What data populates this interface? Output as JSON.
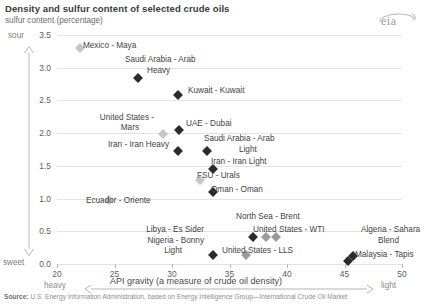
{
  "header": {
    "title": "Density and sulfur content of selected crude oils",
    "subtitle": "sulfur content (percentage)",
    "logo_text": "eia"
  },
  "axes": {
    "y_ticks": [
      "3.5",
      "3.0",
      "2.5",
      "2.0",
      "1.5",
      "1.0",
      "0.5",
      "0.0"
    ],
    "x_ticks": [
      "20",
      "25",
      "30",
      "35",
      "40",
      "45",
      "50"
    ],
    "y_top_label": "sour",
    "y_bottom_label": "sweet",
    "x_left_label": "heavy",
    "x_right_label": "light",
    "x_title": "API gravity (a measure of crude oil density)"
  },
  "footer": {
    "source_prefix": "Source:",
    "source_text": " U.S. Energy Information Administration, based on Energy Intelligence Group—International Crude Oil Market"
  },
  "chart_data": {
    "type": "scatter",
    "title": "Density and sulfur content of selected crude oils",
    "xlabel": "API gravity (a measure of crude oil density)",
    "ylabel": "sulfur content (percentage)",
    "xlim": [
      20,
      50
    ],
    "ylim": [
      0.0,
      3.5
    ],
    "grid": true,
    "legend": "none",
    "points": [
      {
        "label": "Mexico - Maya",
        "x": 22.0,
        "y": 3.3,
        "color": "#c6c6c6"
      },
      {
        "label": "Saudi Arabia - Arab Heavy",
        "x": 27.0,
        "y": 2.85,
        "color": "#2b2b2b"
      },
      {
        "label": "Kuwait - Kuwait",
        "x": 30.5,
        "y": 2.58,
        "color": "#2b2b2b"
      },
      {
        "label": "United States - Mars",
        "x": 29.2,
        "y": 1.98,
        "color": "#c6c6c6"
      },
      {
        "label": "UAE - Dubai",
        "x": 30.6,
        "y": 2.05,
        "color": "#2b2b2b"
      },
      {
        "label": "Iran - Iran Heavy",
        "x": 30.5,
        "y": 1.73,
        "color": "#2b2b2b"
      },
      {
        "label": "Saudi Arabia - Arab Light",
        "x": 33.0,
        "y": 1.73,
        "color": "#2b2b2b"
      },
      {
        "label": "Iran - Iran Light",
        "x": 33.6,
        "y": 1.45,
        "color": "#2b2b2b"
      },
      {
        "label": "FSU - Urals",
        "x": 32.4,
        "y": 1.28,
        "color": "#c6c6c6"
      },
      {
        "label": "Oman - Oman",
        "x": 33.6,
        "y": 1.1,
        "color": "#2b2b2b"
      },
      {
        "label": "Ecuador - Oriente",
        "x": 24.5,
        "y": 0.98,
        "color": "#c6c6c6"
      },
      {
        "label": "Libya - Es Sider",
        "x": 37.0,
        "y": 0.41,
        "color": "#2b2b2b"
      },
      {
        "label": "North Sea - Brent",
        "x": 38.2,
        "y": 0.41,
        "color": "#9b9b9b"
      },
      {
        "label": "United States - WTI",
        "x": 39.0,
        "y": 0.41,
        "color": "#9b9b9b"
      },
      {
        "label": "Nigeria - Bonny Light",
        "x": 33.6,
        "y": 0.14,
        "color": "#2b2b2b"
      },
      {
        "label": "United States - LLS",
        "x": 36.4,
        "y": 0.14,
        "color": "#9b9b9b"
      },
      {
        "label": "Algeria - Sahara Blend",
        "x": 45.7,
        "y": 0.12,
        "color": "#2b2b2b"
      },
      {
        "label": "Malaysia - Tapis",
        "x": 45.3,
        "y": 0.04,
        "color": "#2b2b2b"
      }
    ],
    "annotations": [
      {
        "text": "Mexico - Maya"
      },
      {
        "text": "Saudi Arabia - Arab"
      },
      {
        "text": "Heavy"
      },
      {
        "text": "Kuwait - Kuwait"
      },
      {
        "text": "United States -"
      },
      {
        "text": "Mars"
      },
      {
        "text": "UAE - Dubai"
      },
      {
        "text": "Iran - Iran Heavy"
      },
      {
        "text": "Saudi Arabia - Arab"
      },
      {
        "text": "Light"
      },
      {
        "text": "Iran - Iran Light"
      },
      {
        "text": "FSU - Urals"
      },
      {
        "text": "Oman - Oman"
      },
      {
        "text": "Ecuador - Oriente"
      },
      {
        "text": "North Sea - Brent"
      },
      {
        "text": "Libya - Es Sider"
      },
      {
        "text": "United States - WTI"
      },
      {
        "text": "Nigeria - Bonny"
      },
      {
        "text": "Light"
      },
      {
        "text": "United States - LLS"
      },
      {
        "text": "Algeria - Sahara"
      },
      {
        "text": "Blend"
      },
      {
        "text": "Malaysia - Tapis"
      }
    ]
  },
  "labels": {
    "mexico_maya": "Mexico - Maya",
    "sa_heavy_1": "Saudi Arabia - Arab",
    "sa_heavy_2": "Heavy",
    "kuwait": "Kuwait - Kuwait",
    "us_mars_1": "United States -",
    "us_mars_2": "Mars",
    "uae_dubai": "UAE - Dubai",
    "iran_heavy": "Iran - Iran Heavy",
    "sa_light_1": "Saudi Arabia - Arab",
    "sa_light_2": "Light",
    "iran_light": "Iran - Iran Light",
    "fsu_urals": "FSU - Urals",
    "oman": "Oman - Oman",
    "ecuador": "Ecuador - Oriente",
    "brent": "North Sea - Brent",
    "libya": "Libya - Es Sider",
    "wti": "United States - WTI",
    "nigeria_1": "Nigeria - Bonny",
    "nigeria_2": "Light",
    "lls": "United States - LLS",
    "algeria_1": "Algeria - Sahara",
    "algeria_2": "Blend",
    "malaysia": "Malaysia - Tapis"
  }
}
